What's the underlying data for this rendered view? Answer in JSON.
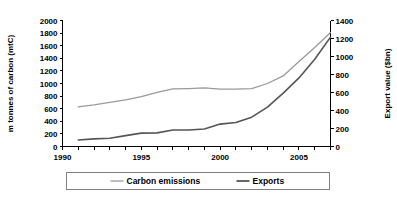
{
  "chart_data": {
    "type": "line",
    "title": "",
    "subtitle": "",
    "xlabel": "",
    "ylabel": "m tonnes of carbon (mtC)",
    "ylabel_right": "Export value ($bn)",
    "grid": false,
    "legend_position": "bottom",
    "x": [
      1991,
      1992,
      1993,
      1994,
      1995,
      1996,
      1997,
      1998,
      1999,
      2000,
      2001,
      2002,
      2003,
      2004,
      2005,
      2006,
      2007
    ],
    "xlim": [
      1990,
      2007
    ],
    "xticks": [
      1990,
      1991,
      1992,
      1993,
      1994,
      1995,
      1996,
      1997,
      1998,
      1999,
      2000,
      2001,
      2002,
      2003,
      2004,
      2005,
      2006,
      2007
    ],
    "xtick_labels_major": [
      "1990",
      "1995",
      "2000",
      "2005"
    ],
    "xtick_major_values": [
      1990,
      1995,
      2000,
      2005
    ],
    "ylim": [
      0,
      2000
    ],
    "yticks": [
      0,
      200,
      400,
      600,
      800,
      1000,
      1200,
      1400,
      1600,
      1800,
      2000
    ],
    "ytick_labels": [
      "0",
      "200",
      "400",
      "600",
      "800",
      "1000",
      "1200",
      "1400",
      "1600",
      "1800",
      "2000"
    ],
    "ylim_right": [
      0,
      1400
    ],
    "yticks_right": [
      0,
      200,
      400,
      600,
      800,
      1000,
      1200,
      1400
    ],
    "ytick_labels_right": [
      "0",
      "200",
      "400",
      "600",
      "800",
      "1000",
      "1200",
      "1400"
    ],
    "series": [
      {
        "name": "Carbon emissions",
        "axis": "left",
        "color": "#9a9a9a",
        "width": 1.3,
        "unit": "mtC",
        "values": [
          630,
          660,
          700,
          740,
          790,
          860,
          915,
          920,
          930,
          910,
          910,
          920,
          1000,
          1120,
          1350,
          1570,
          1810
        ]
      },
      {
        "name": "Exports",
        "axis": "right",
        "color": "#555555",
        "width": 1.6,
        "unit": "$bn",
        "values": [
          72,
          85,
          92,
          121,
          149,
          151,
          183,
          183,
          195,
          249,
          266,
          326,
          438,
          593,
          762,
          969,
          1215
        ]
      }
    ]
  },
  "legend": {
    "items": [
      {
        "label": "Carbon emissions",
        "color": "#9a9a9a"
      },
      {
        "label": "Exports",
        "color": "#555555"
      }
    ]
  },
  "colors": {
    "background": "#ffffff",
    "axis": "#000000",
    "carbon_emissions": "#9a9a9a",
    "exports": "#555555",
    "legend_border": "#808080"
  }
}
